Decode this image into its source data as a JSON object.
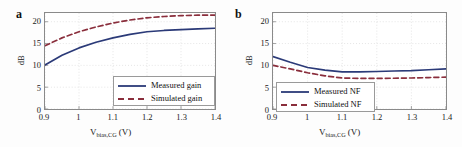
{
  "figure": {
    "background": "#fdfdfd",
    "colors": {
      "measured": "#2b3a78",
      "simulated": "#8a2e3c",
      "grid": "#d9d9d9",
      "axis": "#8a8a8a",
      "text": "#1a1a1a"
    }
  },
  "panels": [
    {
      "label": "a",
      "ylabel": "dB",
      "xlabel_main": "V",
      "xlabel_sub": "bias,CG",
      "xlabel_unit": " (V)",
      "yticks": [
        "0",
        "5",
        "10",
        "15",
        "20"
      ],
      "xticks": [
        "0.9",
        "1",
        "1.1",
        "1.2",
        "1.3",
        "1.4"
      ],
      "legend": [
        {
          "label": "Measured gain",
          "style": "solid",
          "color": "#2b3a78"
        },
        {
          "label": "Simulated gain",
          "style": "dashed",
          "color": "#8a2e3c"
        }
      ]
    },
    {
      "label": "b",
      "ylabel": "dB",
      "xlabel_main": "V",
      "xlabel_sub": "bias,CG",
      "xlabel_unit": " (V)",
      "yticks": [
        "0",
        "5",
        "10",
        "15",
        "20"
      ],
      "xticks": [
        "0.9",
        "1",
        "1.1",
        "1.2",
        "1.3",
        "1.4"
      ],
      "legend": [
        {
          "label": "Measured NF",
          "style": "solid",
          "color": "#2b3a78"
        },
        {
          "label": "Simulated NF",
          "style": "dashed",
          "color": "#8a2e3c"
        }
      ]
    }
  ],
  "chart_data": [
    {
      "type": "line",
      "title": "a",
      "xlabel": "V_bias,CG (V)",
      "ylabel": "dB",
      "xlim": [
        0.9,
        1.4
      ],
      "ylim": [
        0,
        22
      ],
      "yticks": [
        0,
        5,
        10,
        15,
        20
      ],
      "xticks": [
        0.9,
        1.0,
        1.1,
        1.2,
        1.3,
        1.4
      ],
      "grid": true,
      "legend_position": "lower-right",
      "x": [
        0.9,
        0.95,
        1.0,
        1.05,
        1.1,
        1.15,
        1.2,
        1.25,
        1.3,
        1.35,
        1.4
      ],
      "series": [
        {
          "name": "Measured gain",
          "style": "solid",
          "color": "#2b3a78",
          "values": [
            10.1,
            12.3,
            14.0,
            15.3,
            16.3,
            17.1,
            17.7,
            18.0,
            18.2,
            18.35,
            18.5
          ]
        },
        {
          "name": "Simulated gain",
          "style": "dashed",
          "color": "#8a2e3c",
          "values": [
            14.5,
            16.3,
            17.7,
            18.8,
            19.7,
            20.4,
            20.9,
            21.2,
            21.4,
            21.5,
            21.5
          ]
        }
      ]
    },
    {
      "type": "line",
      "title": "b",
      "xlabel": "V_bias,CG (V)",
      "ylabel": "dB",
      "xlim": [
        0.9,
        1.4
      ],
      "ylim": [
        0,
        22
      ],
      "yticks": [
        0,
        5,
        10,
        15,
        20
      ],
      "xticks": [
        0.9,
        1.0,
        1.1,
        1.2,
        1.3,
        1.4
      ],
      "grid": true,
      "legend_position": "lower-left",
      "x": [
        0.9,
        0.95,
        1.0,
        1.05,
        1.1,
        1.15,
        1.2,
        1.25,
        1.3,
        1.35,
        1.4
      ],
      "series": [
        {
          "name": "Measured NF",
          "style": "solid",
          "color": "#2b3a78",
          "values": [
            12.0,
            10.7,
            9.5,
            8.9,
            8.5,
            8.5,
            8.6,
            8.7,
            8.8,
            9.0,
            9.2
          ]
        },
        {
          "name": "Simulated NF",
          "style": "dashed",
          "color": "#8a2e3c",
          "values": [
            10.0,
            9.2,
            8.3,
            7.6,
            7.1,
            7.0,
            7.0,
            7.05,
            7.1,
            7.2,
            7.3
          ]
        }
      ]
    }
  ]
}
